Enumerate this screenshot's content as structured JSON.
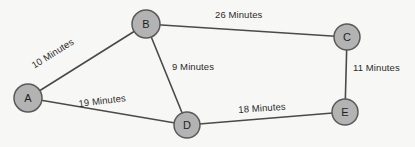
{
  "diagram": {
    "background_color": "#f7f7f5",
    "node_fill_color": "#b3b3b3",
    "node_stroke_color": "#5a5a5a",
    "edge_color": "#4a4a4a",
    "label_color": "#2b2b2b",
    "nodes": [
      {
        "id": "A",
        "label": "A",
        "cx": 28,
        "cy": 98,
        "r": 14
      },
      {
        "id": "B",
        "label": "B",
        "cx": 146,
        "cy": 24,
        "r": 14
      },
      {
        "id": "C",
        "label": "C",
        "cx": 347,
        "cy": 37,
        "r": 13
      },
      {
        "id": "D",
        "label": "D",
        "cx": 187,
        "cy": 125,
        "r": 13
      },
      {
        "id": "E",
        "label": "E",
        "cx": 345,
        "cy": 112,
        "r": 13
      }
    ],
    "edges": [
      {
        "id": "A-B",
        "from": "A",
        "to": "B",
        "weight": 10,
        "unit": "Minutes",
        "label": "10 Minutes",
        "label_x": 30,
        "label_y": 62,
        "label_rotation": -32
      },
      {
        "id": "B-C",
        "from": "B",
        "to": "C",
        "weight": 26,
        "unit": "Minutes",
        "label": "26 Minutes",
        "label_x": 215,
        "label_y": 10,
        "label_rotation": 0
      },
      {
        "id": "B-D",
        "from": "B",
        "to": "D",
        "weight": 9,
        "unit": "Minutes",
        "label": "9 Minutes",
        "label_x": 172,
        "label_y": 62,
        "label_rotation": 0
      },
      {
        "id": "A-D",
        "from": "A",
        "to": "D",
        "weight": 19,
        "unit": "Minutes",
        "label": "19 Minutes",
        "label_x": 78,
        "label_y": 99,
        "label_rotation": -7
      },
      {
        "id": "D-E",
        "from": "D",
        "to": "E",
        "weight": 18,
        "unit": "Minutes",
        "label": "18 Minutes",
        "label_x": 238,
        "label_y": 105,
        "label_rotation": -4
      },
      {
        "id": "C-E",
        "from": "C",
        "to": "E",
        "weight": 11,
        "unit": "Minutes",
        "label": "11 Minutes",
        "label_x": 353,
        "label_y": 63,
        "label_rotation": 0
      }
    ]
  }
}
